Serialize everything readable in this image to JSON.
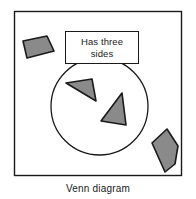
{
  "figure": {
    "caption": "Venn diagram",
    "frame": {
      "x": 14,
      "y": 11,
      "width": 168,
      "height": 165,
      "stroke_color": "#1a1a1a",
      "fill_color": "#ffffff"
    },
    "circle": {
      "label": "Has three sides",
      "center_x": 99.5,
      "center_y": 106.5,
      "radius": 48.5,
      "stroke_color": "#1a1a1a",
      "fill_color": "none"
    },
    "label_box": {
      "text": "Has three\nsides",
      "line1": "Has three",
      "line2": "sides",
      "x": 65,
      "y": 31,
      "width": 74,
      "height": 33,
      "border_color": "#1a1a1a",
      "background_color": "#ffffff"
    },
    "shapes": [
      {
        "name": "quadrilateral",
        "sides": 4,
        "inside_circle": false,
        "fill_color": "#8a8a8a",
        "stroke_color": "#1a1a1a",
        "points": "23,41 47,36 54,51 27,58"
      },
      {
        "name": "triangle-upper",
        "sides": 3,
        "inside_circle": true,
        "fill_color": "#8a8a8a",
        "stroke_color": "#1a1a1a",
        "points": "66,83 92,79 96,101"
      },
      {
        "name": "triangle-lower",
        "sides": 3,
        "inside_circle": true,
        "fill_color": "#8a8a8a",
        "stroke_color": "#1a1a1a",
        "points": "122,93 126,125 101,121"
      },
      {
        "name": "pentagon",
        "sides": 5,
        "inside_circle": false,
        "fill_color": "#8a8a8a",
        "stroke_color": "#1a1a1a",
        "points": "167,129 178,146 175,164 165,172 152,143"
      }
    ]
  }
}
